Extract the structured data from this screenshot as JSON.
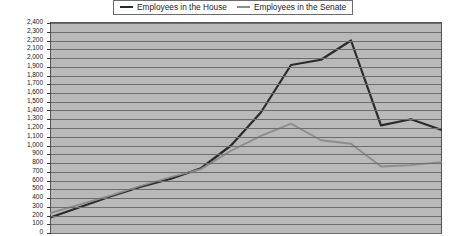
{
  "legend": {
    "position": "top-center",
    "entries": [
      {
        "label": "Employees in the House",
        "color": "#2b2b2b",
        "icon": "line-swatch-icon"
      },
      {
        "label": "Employees in the Senate",
        "color": "#8d8d8d",
        "icon": "line-swatch-icon"
      }
    ]
  },
  "chart_data": {
    "type": "line",
    "title": "",
    "subtitle": "",
    "xlabel": "",
    "ylabel": "",
    "ylim": [
      0,
      2400
    ],
    "ytick_step": 100,
    "grid": true,
    "grid_axis": "y",
    "legend_position": "top-center",
    "plot_background": "#b9b9b9",
    "ytick_labels": [
      "2,400",
      "2,300",
      "2,200",
      "2,100",
      "2,000",
      "1,900",
      "1,800",
      "1,700",
      "1,600",
      "1,500",
      "1,400",
      "1,300",
      "1,200",
      "1,100",
      "1,000",
      "900",
      "800",
      "700",
      "600",
      "500",
      "400",
      "300",
      "200",
      "100",
      "0"
    ],
    "x": [
      0,
      1,
      2,
      3,
      4,
      5,
      6,
      7,
      8,
      9,
      10,
      11,
      12,
      13
    ],
    "series": [
      {
        "name": "Employees in the House",
        "color": "#2b2b2b",
        "values": [
          180,
          300,
          420,
          530,
          620,
          740,
          1000,
          1380,
          1920,
          1980,
          2200,
          1230,
          1300,
          1180
        ]
      },
      {
        "name": "Employees in the Senate",
        "color": "#8d8d8d",
        "values": [
          230,
          330,
          430,
          540,
          640,
          730,
          940,
          1110,
          1250,
          1060,
          1020,
          760,
          775,
          810
        ]
      }
    ],
    "annotations": []
  }
}
